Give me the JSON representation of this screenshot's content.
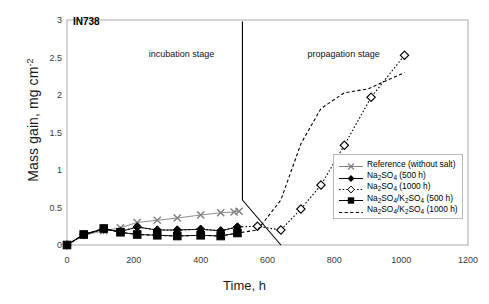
{
  "chart_data": {
    "type": "line",
    "title": "IN738",
    "xlabel": "Time, h",
    "ylabel_prefix": "Mass gain, mg cm",
    "ylabel_sup": "-2",
    "xlim": [
      0,
      1200
    ],
    "ylim": [
      0,
      3
    ],
    "xticks": [
      0,
      200,
      400,
      600,
      800,
      1000,
      1200
    ],
    "yticks": [
      0,
      0.5,
      1,
      1.5,
      2,
      2.5,
      3
    ],
    "grid": false,
    "legend_position": "lower-right",
    "annotations": [
      {
        "name": "incubation-stage-label",
        "text": "incubation stage",
        "x": 430,
        "y": 2.55
      },
      {
        "name": "propagation-stage-label",
        "text": "propagation stage",
        "x": 720,
        "y": 2.55
      }
    ],
    "divider_line": {
      "x": 525,
      "y_from": 2.98,
      "y_to": 0.6
    },
    "boundary_polyline": [
      [
        525,
        0.6
      ],
      [
        640,
        0.0
      ]
    ],
    "series": [
      {
        "name": "Reference (without salt)",
        "marker": "cross",
        "line": "solid",
        "color": "#808080",
        "x": [
          0,
          50,
          110,
          160,
          210,
          270,
          330,
          400,
          460,
          500,
          515
        ],
        "y": [
          0.0,
          0.13,
          0.19,
          0.23,
          0.3,
          0.33,
          0.36,
          0.4,
          0.43,
          0.44,
          0.45
        ]
      },
      {
        "name": "Na2SO4 (500 h)",
        "marker": "diamond-filled",
        "line": "solid",
        "color": "#000000",
        "x": [
          0,
          50,
          110,
          160,
          210,
          270,
          330,
          400,
          460,
          510
        ],
        "y": [
          0.0,
          0.14,
          0.21,
          0.18,
          0.24,
          0.2,
          0.2,
          0.21,
          0.19,
          0.24
        ]
      },
      {
        "name": "Na2SO4 (1000 h)",
        "marker": "diamond-open",
        "line": "dotted",
        "color": "#000000",
        "x": [
          0,
          50,
          110,
          160,
          210,
          270,
          330,
          400,
          460,
          510,
          570,
          640,
          700,
          760,
          830,
          910,
          1010
        ],
        "y": [
          0.0,
          0.14,
          0.21,
          0.18,
          0.24,
          0.2,
          0.2,
          0.21,
          0.19,
          0.24,
          0.25,
          0.2,
          0.48,
          0.8,
          1.33,
          1.97,
          2.53
        ]
      },
      {
        "name": "Na2SO4/K2SO4 (500 h)",
        "marker": "square-filled",
        "line": "solid",
        "color": "#000000",
        "x": [
          0,
          50,
          110,
          160,
          210,
          270,
          330,
          400,
          460,
          510
        ],
        "y": [
          0.0,
          0.14,
          0.22,
          0.17,
          0.14,
          0.13,
          0.12,
          0.13,
          0.12,
          0.16
        ]
      },
      {
        "name": "Na2SO4/K2SO4 (1000 h)",
        "marker": "none",
        "line": "dashed",
        "color": "#000000",
        "x": [
          0,
          50,
          110,
          160,
          210,
          270,
          330,
          400,
          460,
          510,
          570,
          640,
          700,
          760,
          830,
          900,
          1010
        ],
        "y": [
          0.0,
          0.14,
          0.22,
          0.17,
          0.14,
          0.13,
          0.12,
          0.13,
          0.12,
          0.16,
          0.2,
          0.6,
          1.35,
          1.82,
          2.03,
          2.08,
          2.3
        ]
      }
    ]
  },
  "legend": {
    "items": [
      {
        "label_html": "Reference (without salt)",
        "key": "cross-solid-gray"
      },
      {
        "label_html": "Na<sub>2</sub>SO<sub>4</sub> (500 h)",
        "key": "diamond-filled-solid"
      },
      {
        "label_html": "Na<sub>2</sub>SO<sub>4</sub> (1000 h)",
        "key": "diamond-open-dotted"
      },
      {
        "label_html": "Na<sub>2</sub>SO<sub>4</sub>/K<sub>2</sub>SO<sub>4</sub> (500 h)",
        "key": "square-filled-solid"
      },
      {
        "label_html": "Na<sub>2</sub>SO<sub>4</sub>/K<sub>2</sub>SO<sub>4</sub> (1000 h)",
        "key": "dashed-only"
      }
    ]
  },
  "colors": {
    "frame": "#aaaaaa",
    "reference": "#8c8c8c",
    "data": "#000000",
    "axis_text": "#3a3a3a"
  }
}
